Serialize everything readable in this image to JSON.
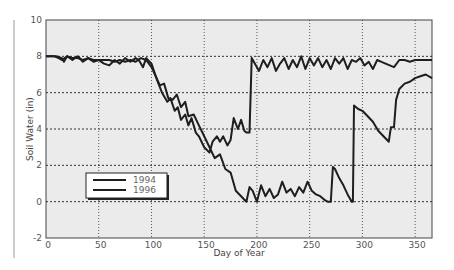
{
  "chart_data": {
    "type": "line",
    "title": "",
    "xlabel": "Day of Year",
    "ylabel": "Soil Water (in)",
    "xlim": [
      0,
      366
    ],
    "ylim": [
      -2,
      10
    ],
    "xticks": [
      0,
      50,
      100,
      150,
      200,
      250,
      300,
      350
    ],
    "yticks": [
      -2,
      0,
      2,
      4,
      6,
      8,
      10
    ],
    "grid": true,
    "legend_position": "lower-left",
    "series": [
      {
        "name": "1994",
        "x": [
          0,
          10,
          15,
          17,
          20,
          25,
          30,
          32,
          35,
          40,
          45,
          50,
          55,
          60,
          65,
          70,
          75,
          80,
          85,
          88,
          92,
          95,
          100,
          103,
          106,
          110,
          115,
          118,
          122,
          125,
          128,
          132,
          135,
          138,
          142,
          145,
          150,
          155,
          158,
          162,
          165,
          168,
          172,
          175,
          178,
          182,
          185,
          188,
          190,
          193,
          195,
          198,
          202,
          206,
          210,
          214,
          218,
          222,
          226,
          230,
          234,
          238,
          242,
          246,
          250,
          254,
          258,
          262,
          266,
          270,
          274,
          278,
          282,
          286,
          290,
          294,
          298,
          302,
          306,
          310,
          314,
          318,
          322,
          326,
          330,
          335,
          340,
          345,
          350,
          355,
          360,
          366
        ],
        "values": [
          8,
          8,
          7.9,
          7.7,
          8,
          7.8,
          8,
          7.9,
          7.7,
          7.9,
          7.7,
          7.8,
          7.6,
          7.5,
          7.8,
          7.6,
          7.9,
          7.7,
          7.9,
          7.8,
          7.4,
          7.9,
          7.6,
          7.1,
          6.6,
          6.0,
          5.5,
          5.7,
          5.0,
          5.2,
          4.5,
          4.8,
          4.2,
          4.6,
          3.8,
          3.6,
          3.0,
          2.7,
          3.3,
          3.6,
          3.3,
          3.6,
          3.1,
          3.4,
          4.6,
          4.0,
          4.5,
          3.9,
          3.8,
          3.8,
          7.9,
          7.6,
          7.2,
          7.8,
          7.4,
          7.9,
          7.2,
          7.6,
          7.9,
          7.3,
          7.8,
          7.4,
          8.0,
          7.3,
          7.9,
          7.5,
          7.9,
          7.4,
          7.8,
          7.3,
          7.9,
          7.6,
          7.9,
          7.3,
          7.8,
          7.7,
          7.9,
          7.5,
          7.7,
          7.3,
          7.8,
          7.7,
          7.6,
          7.5,
          7.4,
          7.8,
          7.8,
          7.7,
          7.8,
          7.8,
          7.8,
          7.8
        ]
      },
      {
        "name": "1996",
        "x": [
          0,
          8,
          12,
          15,
          20,
          25,
          30,
          35,
          40,
          45,
          50,
          55,
          60,
          65,
          70,
          75,
          80,
          85,
          90,
          95,
          100,
          104,
          108,
          112,
          116,
          120,
          124,
          128,
          132,
          135,
          140,
          145,
          150,
          155,
          160,
          165,
          170,
          175,
          180,
          185,
          190,
          193,
          196,
          200,
          204,
          208,
          212,
          216,
          220,
          224,
          228,
          232,
          236,
          240,
          244,
          248,
          252,
          256,
          260,
          264,
          267,
          270,
          272,
          274,
          278,
          282,
          286,
          290,
          291,
          292,
          296,
          300,
          305,
          310,
          315,
          320,
          325,
          327,
          330,
          332,
          335,
          340,
          345,
          350,
          355,
          360,
          366
        ],
        "values": [
          8,
          8,
          7.9,
          7.8,
          8,
          7.9,
          7.9,
          7.8,
          7.9,
          7.8,
          7.8,
          7.8,
          7.8,
          7.7,
          7.8,
          7.7,
          7.8,
          7.7,
          7.9,
          7.8,
          7.4,
          6.9,
          6.4,
          6.5,
          5.7,
          5.6,
          5.9,
          5.2,
          5.5,
          4.7,
          4.8,
          4.2,
          3.6,
          3.0,
          2.4,
          2.6,
          1.8,
          1.6,
          0.6,
          0.3,
          0,
          0.8,
          0.6,
          0,
          0.9,
          0.3,
          0.7,
          0.2,
          0.4,
          1.1,
          0.5,
          0.7,
          0.3,
          0.8,
          0.5,
          1.1,
          0.6,
          0.4,
          0.3,
          0.1,
          0,
          0,
          1.9,
          1.8,
          1.3,
          0.9,
          0.4,
          0,
          0,
          5.3,
          5.1,
          5.0,
          4.7,
          4.4,
          3.9,
          3.6,
          3.3,
          4.1,
          4.1,
          5.6,
          6.2,
          6.5,
          6.6,
          6.8,
          6.9,
          7.0,
          6.8
        ]
      }
    ]
  },
  "axes": {
    "xlabel": "Day of Year",
    "ylabel": "Soil Water (in)",
    "xtick_labels": [
      "0",
      "50",
      "100",
      "150",
      "200",
      "250",
      "300",
      "350"
    ],
    "ytick_labels": [
      "-2",
      "0",
      "2",
      "4",
      "6",
      "8",
      "10"
    ]
  },
  "legend": {
    "items": [
      {
        "label": "1994"
      },
      {
        "label": "1996"
      }
    ]
  },
  "colors": {
    "plot_background": "#ebebeb",
    "line": "#1e1e1e",
    "grid": "#333333",
    "axis": "#444444",
    "tick_text": "#555555",
    "side_rule": "#9a9a9a"
  }
}
